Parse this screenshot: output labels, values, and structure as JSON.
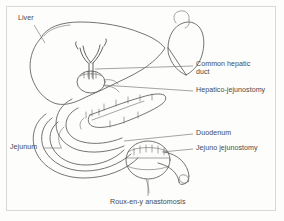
{
  "figure": {
    "ink_color": "#5b5b5b",
    "leader_color": "#7d7d7d",
    "background": "#fdfdfc",
    "frame_color": "#d8d8d8"
  },
  "labels": [
    {
      "id": "liver",
      "text": "Liver",
      "x": 18,
      "y": 18
    },
    {
      "id": "common-duct",
      "text": "Common hepatic\nduct",
      "x": 196,
      "y": 60
    },
    {
      "id": "hep-jej",
      "text": "Hepatico-jejunostomy",
      "x": 196,
      "y": 88
    },
    {
      "id": "duodenum",
      "text": "Duodenum",
      "x": 196,
      "y": 131
    },
    {
      "id": "jejuno-jej",
      "text": "Jejuno jejunostomy",
      "x": 196,
      "y": 146
    },
    {
      "id": "jejunum",
      "text": "Jejunum",
      "x": 10,
      "y": 145
    },
    {
      "id": "roux-en-y",
      "text": "Roux-en-y anastomosis",
      "x": 110,
      "y": 200
    }
  ],
  "structures": [
    {
      "id": "liver",
      "name": "Liver"
    },
    {
      "id": "stomach",
      "name": "Stomach"
    },
    {
      "id": "common-hepatic-duct",
      "name": "Common hepatic duct"
    },
    {
      "id": "hepaticojejunostomy",
      "name": "Hepatico-jejunostomy"
    },
    {
      "id": "duodenum",
      "name": "Duodenum"
    },
    {
      "id": "pancreas",
      "name": "Pancreas"
    },
    {
      "id": "jejunum",
      "name": "Jejunum"
    },
    {
      "id": "jejunojejunostomy",
      "name": "Jejuno jejunostomy"
    },
    {
      "id": "roux-limb",
      "name": "Roux-en-y anastomosis limb"
    }
  ]
}
